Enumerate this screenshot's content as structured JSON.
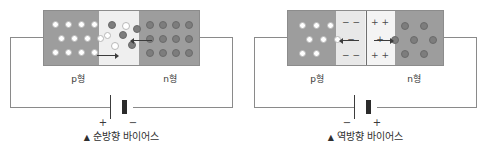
{
  "figure": {
    "kind": "pn-junction-bias-diagram-pair",
    "background_color": "#ffffff"
  },
  "colors": {
    "semiconductor_body": "#9d9d9d",
    "depletion_zone": "#efefef",
    "hole_fill": "#ffffff",
    "electron_fill": "#7d7d7d",
    "wire": "#8a8a8a",
    "battery_terminal": "#2b2b2b",
    "text": "#3a3a3a"
  },
  "panels": [
    {
      "id": "forward-bias",
      "caption_marker": "▲",
      "caption_text": "순방향 바이어스",
      "region_labels": {
        "p": "p형",
        "n": "n형"
      },
      "battery": {
        "left_terminal": "+",
        "right_terminal": "−"
      },
      "depletion_signs": [],
      "arrows": [
        {
          "name": "hole-drift-arrow",
          "direction": "right"
        },
        {
          "name": "electron-drift-arrow",
          "direction": "left"
        }
      ],
      "carrier_counts": {
        "holes": 15,
        "electrons": 15
      }
    },
    {
      "id": "reverse-bias",
      "caption_marker": "▲",
      "caption_text": "역방향 바이어스",
      "region_labels": {
        "p": "p형",
        "n": "n형"
      },
      "battery": {
        "left_terminal": "−",
        "right_terminal": "+"
      },
      "depletion_signs": [
        {
          "row": "top",
          "side": "negative",
          "text": "− −"
        },
        {
          "row": "middle",
          "side": "negative",
          "text": "−"
        },
        {
          "row": "bottom",
          "side": "negative",
          "text": "− −"
        },
        {
          "row": "top",
          "side": "positive",
          "text": "+ +"
        },
        {
          "row": "middle",
          "side": "positive",
          "text": "+"
        },
        {
          "row": "bottom",
          "side": "positive",
          "text": "+ +"
        }
      ],
      "arrows": [
        {
          "name": "hole-pullback-arrow",
          "direction": "left"
        },
        {
          "name": "electron-pullback-arrow",
          "direction": "right"
        }
      ],
      "carrier_counts": {
        "holes": 8,
        "electrons": 7
      }
    }
  ],
  "carriers": {
    "forward": {
      "holes": [
        {
          "x": 9,
          "y": 11
        },
        {
          "x": 22,
          "y": 11
        },
        {
          "x": 35,
          "y": 11
        },
        {
          "x": 48,
          "y": 11
        },
        {
          "x": 15,
          "y": 25
        },
        {
          "x": 28,
          "y": 25
        },
        {
          "x": 41,
          "y": 25
        },
        {
          "x": 54,
          "y": 25
        },
        {
          "x": 9,
          "y": 40
        },
        {
          "x": 22,
          "y": 40
        },
        {
          "x": 35,
          "y": 40
        },
        {
          "x": 48,
          "y": 40
        },
        {
          "x": 61,
          "y": 28
        },
        {
          "x": 68,
          "y": 38
        },
        {
          "x": 79,
          "y": 18
        }
      ],
      "electrons": [
        {
          "x": 65,
          "y": 17
        },
        {
          "x": 76,
          "y": 28
        },
        {
          "x": 85,
          "y": 38
        },
        {
          "x": 90,
          "y": 22
        },
        {
          "x": 103,
          "y": 11
        },
        {
          "x": 116,
          "y": 11
        },
        {
          "x": 129,
          "y": 11
        },
        {
          "x": 142,
          "y": 11
        },
        {
          "x": 103,
          "y": 25
        },
        {
          "x": 116,
          "y": 25
        },
        {
          "x": 129,
          "y": 25
        },
        {
          "x": 142,
          "y": 25
        },
        {
          "x": 103,
          "y": 40
        },
        {
          "x": 116,
          "y": 40
        },
        {
          "x": 129,
          "y": 40
        }
      ]
    },
    "reverse": {
      "holes": [
        {
          "x": 12,
          "y": 12
        },
        {
          "x": 26,
          "y": 12
        },
        {
          "x": 40,
          "y": 12
        },
        {
          "x": 19,
          "y": 26
        },
        {
          "x": 33,
          "y": 26
        },
        {
          "x": 47,
          "y": 26
        },
        {
          "x": 12,
          "y": 40
        },
        {
          "x": 26,
          "y": 40
        }
      ],
      "electrons": [
        {
          "x": 114,
          "y": 12
        },
        {
          "x": 133,
          "y": 12
        },
        {
          "x": 104,
          "y": 26
        },
        {
          "x": 123,
          "y": 26
        },
        {
          "x": 114,
          "y": 40
        },
        {
          "x": 133,
          "y": 40
        },
        {
          "x": 142,
          "y": 26
        }
      ]
    }
  }
}
